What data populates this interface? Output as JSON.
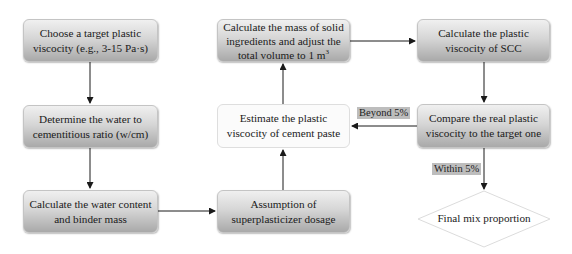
{
  "diagram": {
    "nodes": {
      "choose_target": "Choose a target plastic viscocity (e.g., 3-15 Pa·s)",
      "determine_wcm": "Determine the water to cementitious ratio (w/cm)",
      "calc_water_binder": "Calculate the water content and binder mass",
      "assume_sp": "Assumption of superplasticizer dosage",
      "estimate_paste": "Estimate the plastic viscocity of cement paste",
      "calc_solid_mass_prefix": "Calculate the mass of solid ingredients and adjust the total volume to 1 m",
      "calc_solid_mass_sup": "3",
      "calc_scc": "Calculate the plastic viscocity of SCC",
      "compare": "Compare the real plastic viscocity to the target one",
      "final": "Final mix proportion"
    },
    "edge_labels": {
      "beyond": "Beyond 5%",
      "within": "Within 5%"
    },
    "edges": [
      {
        "from": "choose_target",
        "to": "determine_wcm"
      },
      {
        "from": "determine_wcm",
        "to": "calc_water_binder"
      },
      {
        "from": "calc_water_binder",
        "to": "assume_sp"
      },
      {
        "from": "assume_sp",
        "to": "estimate_paste"
      },
      {
        "from": "estimate_paste",
        "to": "calc_solid_mass"
      },
      {
        "from": "calc_solid_mass",
        "to": "calc_scc"
      },
      {
        "from": "calc_scc",
        "to": "compare"
      },
      {
        "from": "compare",
        "to": "estimate_paste",
        "label": "Beyond 5%"
      },
      {
        "from": "compare",
        "to": "final",
        "label": "Within 5%"
      }
    ],
    "colors": {
      "box_top": "#f0f0f0",
      "box_bottom": "#a9a9a9",
      "label_bg": "#bdbdbd",
      "line": "#1a1a1a"
    }
  }
}
